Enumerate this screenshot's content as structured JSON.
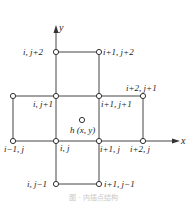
{
  "diagram": {
    "axes": {
      "x_label": "x",
      "y_label": "y"
    },
    "nodes": [
      {
        "id": "i_jp2",
        "label": "i, j+2"
      },
      {
        "id": "ip1_jp2",
        "label": "i+1, j+2"
      },
      {
        "id": "ip2_jp1",
        "label": "i+2, j+1"
      },
      {
        "id": "i_jp1",
        "label": "i, j+1"
      },
      {
        "id": "ip1_jp1",
        "label": "i+1, j+1"
      },
      {
        "id": "im1_j",
        "label": "i−1, j"
      },
      {
        "id": "i_j",
        "label": "i, j"
      },
      {
        "id": "ip1_j",
        "label": "i+1, j"
      },
      {
        "id": "ip2_j",
        "label": "i+2, j"
      },
      {
        "id": "i_jm1",
        "label": "i, j−1"
      },
      {
        "id": "ip1_jm1",
        "label": "i+1, j−1"
      }
    ],
    "interpolation_point": {
      "label": "h (x, y)"
    },
    "caption": "图 · 内插点结构"
  }
}
